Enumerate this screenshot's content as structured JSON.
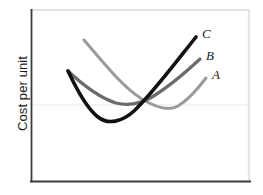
{
  "chart_data": {
    "type": "line",
    "title": "",
    "xlabel": "",
    "ylabel": "Cost per unit",
    "grid": false,
    "legend_position": "curve-end-labels",
    "axis_ticks": false,
    "xlim": [
      0,
      263
    ],
    "ylim": [
      0,
      195
    ],
    "annotations": [
      {
        "name": "curve-end-label-C",
        "text": "C",
        "x": 202,
        "y": 38
      },
      {
        "name": "curve-end-label-B",
        "text": "B",
        "x": 206,
        "y": 60
      },
      {
        "name": "curve-end-label-A",
        "text": "A",
        "x": 212,
        "y": 79
      }
    ],
    "series": [
      {
        "name": "A",
        "label": "A",
        "color": "#9a9a9a",
        "width": 3.0,
        "shape": "u-curve",
        "path": "M84,40 C106,66 124,88 142,99 C160,110 171,110 178,106 C188,100 197,90 206,78",
        "start": [
          84,
          40
        ],
        "minimum": [
          176,
          108
        ],
        "end": [
          206,
          78
        ],
        "values": [
          {
            "x": 84,
            "y": 40
          },
          {
            "x": 100,
            "y": 60
          },
          {
            "x": 118,
            "y": 81
          },
          {
            "x": 136,
            "y": 96
          },
          {
            "x": 152,
            "y": 104
          },
          {
            "x": 166,
            "y": 108
          },
          {
            "x": 178,
            "y": 107
          },
          {
            "x": 190,
            "y": 96
          },
          {
            "x": 206,
            "y": 78
          }
        ]
      },
      {
        "name": "B",
        "label": "B",
        "color": "#6b6b6b",
        "width": 3.2,
        "shape": "u-curve",
        "path": "M68,71 C84,86 100,98 116,103 C128,106 140,104 152,97 C170,86 186,72 200,59",
        "start": [
          68,
          71
        ],
        "minimum": [
          125,
          104
        ],
        "end": [
          200,
          59
        ],
        "values": [
          {
            "x": 68,
            "y": 71
          },
          {
            "x": 82,
            "y": 86
          },
          {
            "x": 96,
            "y": 96
          },
          {
            "x": 110,
            "y": 102
          },
          {
            "x": 125,
            "y": 104
          },
          {
            "x": 140,
            "y": 101
          },
          {
            "x": 155,
            "y": 94
          },
          {
            "x": 175,
            "y": 79
          },
          {
            "x": 200,
            "y": 59
          }
        ]
      },
      {
        "name": "C",
        "label": "C",
        "color": "#111111",
        "width": 3.6,
        "shape": "u-curve",
        "path": "M68,71 C76,88 86,108 98,117 C108,125 122,122 134,111 C152,94 176,62 196,37",
        "start": [
          68,
          71
        ],
        "minimum": [
          108,
          121
        ],
        "end": [
          196,
          37
        ],
        "values": [
          {
            "x": 68,
            "y": 71
          },
          {
            "x": 80,
            "y": 96
          },
          {
            "x": 92,
            "y": 113
          },
          {
            "x": 104,
            "y": 120
          },
          {
            "x": 116,
            "y": 120
          },
          {
            "x": 128,
            "y": 114
          },
          {
            "x": 144,
            "y": 99
          },
          {
            "x": 168,
            "y": 72
          },
          {
            "x": 196,
            "y": 37
          }
        ]
      }
    ]
  },
  "frame": {
    "left_axis_color": "#3a3a3a",
    "bottom_axis_color": "#3a3a3a",
    "top_edge_color": "#e3e3e3",
    "right_edge_color": "#e6e6e6",
    "faint_rule_color": "#efefef",
    "plot_background": "#ffffff"
  }
}
